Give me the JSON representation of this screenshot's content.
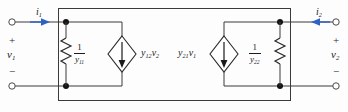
{
  "figure": {
    "name": "two-port-y-parameter-equivalent-circuit",
    "colors": {
      "wire": "#3a3a3a",
      "node": "#1a1a1a",
      "arrow": "#2f62c4",
      "box": "#3a3a3a",
      "text": "#1c1c1c",
      "background": "#fdfdfd"
    }
  },
  "ports": {
    "left": {
      "current_label": "i",
      "current_sub": "1",
      "plus": "+",
      "minus": "−",
      "voltage_label": "v",
      "voltage_sub": "1"
    },
    "right": {
      "current_label": "i",
      "current_sub": "2",
      "plus": "+",
      "minus": "−",
      "voltage_label": "v",
      "voltage_sub": "2"
    }
  },
  "components": {
    "left_resistor": {
      "numerator": "1",
      "denominator": "y",
      "denominator_sub": "11",
      "type": "resistor"
    },
    "right_resistor": {
      "numerator": "1",
      "denominator": "y",
      "denominator_sub": "22",
      "type": "resistor"
    },
    "left_source": {
      "label": "y",
      "label_sub": "12",
      "label_var": "v",
      "label_var_sub": "2",
      "type": "dependent-current-source"
    },
    "right_source": {
      "label": "y",
      "label_sub": "21",
      "label_var": "v",
      "label_var_sub": "1",
      "type": "dependent-current-source"
    }
  }
}
